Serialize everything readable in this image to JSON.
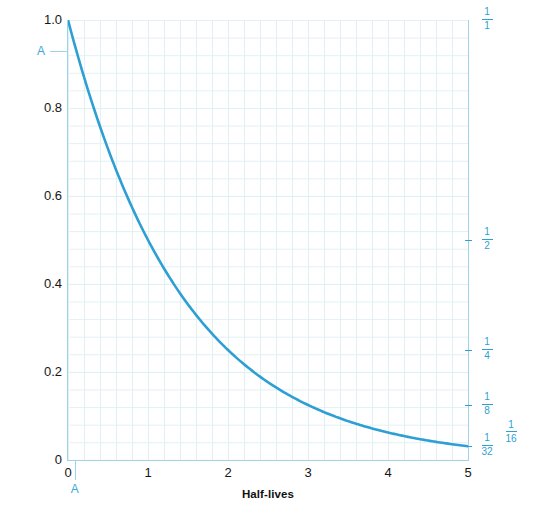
{
  "chart_data": {
    "type": "line",
    "title": "",
    "xlabel": "Half-lives",
    "ylabel_left": "Decimal fraction of sample remaining",
    "ylabel_right": "Rational fraction of sample remaining",
    "xlim": [
      0,
      5
    ],
    "ylim": [
      0,
      1
    ],
    "grid": true,
    "legend": "none",
    "series": [
      {
        "name": "remaining fraction",
        "color": "#2e9fd4",
        "formula": "y = (1/2)^x",
        "x": [
          0,
          0.25,
          0.5,
          0.75,
          1,
          1.25,
          1.5,
          1.75,
          2,
          2.25,
          2.5,
          2.75,
          3,
          3.25,
          3.5,
          3.75,
          4,
          4.25,
          4.5,
          4.75,
          5
        ],
        "y": [
          1.0,
          0.841,
          0.707,
          0.595,
          0.5,
          0.42,
          0.354,
          0.297,
          0.25,
          0.21,
          0.177,
          0.149,
          0.125,
          0.105,
          0.088,
          0.074,
          0.0625,
          0.053,
          0.044,
          0.037,
          0.03125
        ]
      }
    ],
    "x_ticks": [
      {
        "value": 0,
        "label": "0"
      },
      {
        "value": 1,
        "label": "1"
      },
      {
        "value": 2,
        "label": "2"
      },
      {
        "value": 3,
        "label": "3"
      },
      {
        "value": 4,
        "label": "4"
      },
      {
        "value": 5,
        "label": "5"
      }
    ],
    "y_ticks_left": [
      {
        "value": 0,
        "label": "0"
      },
      {
        "value": 0.2,
        "label": "0.2"
      },
      {
        "value": 0.4,
        "label": "0.4"
      },
      {
        "value": 0.6,
        "label": "0.6"
      },
      {
        "value": 0.8,
        "label": "0.8"
      },
      {
        "value": 1.0,
        "label": "1.0"
      }
    ],
    "y_ticks_right": [
      {
        "value": 1.0,
        "numerator": "1",
        "denominator": "1",
        "offset": false
      },
      {
        "value": 0.5,
        "numerator": "1",
        "denominator": "2",
        "offset": false
      },
      {
        "value": 0.25,
        "numerator": "1",
        "denominator": "4",
        "offset": false
      },
      {
        "value": 0.125,
        "numerator": "1",
        "denominator": "8",
        "offset": false
      },
      {
        "value": 0.0625,
        "numerator": "1",
        "denominator": "16",
        "offset": true
      },
      {
        "value": 0.03125,
        "numerator": "1",
        "denominator": "32",
        "offset": false
      }
    ],
    "annotations": [
      {
        "name": "marker-a-left",
        "label": "A",
        "axis": "y",
        "value": 0.93
      },
      {
        "name": "marker-a-bottom",
        "label": "A",
        "axis": "x",
        "value": 0.085
      }
    ]
  },
  "colors": {
    "curve": "#2e9fd4",
    "axis": "#9fd4e8",
    "grid_minor": "#e2f0f4",
    "grid_major": "#cfe7ef",
    "tick_text": "#161616",
    "accent_text": "#3ba9dc",
    "background": "#ffffff"
  }
}
